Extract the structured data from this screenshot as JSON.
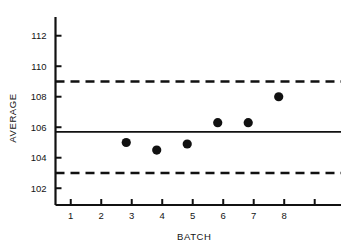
{
  "chart_data": {
    "type": "scatter",
    "title": "",
    "subtitle": "",
    "xlabel": "BATCH",
    "ylabel": "AVERAGE",
    "x": [
      3,
      4,
      5,
      6,
      7,
      8
    ],
    "values": [
      105.0,
      104.5,
      104.9,
      106.3,
      106.3,
      108.0
    ],
    "series": [
      {
        "name": "Batch average",
        "x": [
          3,
          4,
          5,
          6,
          7,
          8
        ],
        "values": [
          105.0,
          104.5,
          104.9,
          106.3,
          106.3,
          108.0
        ]
      }
    ],
    "xlim": [
      0.5,
      9.6
    ],
    "ylim": [
      100.9,
      112.9
    ],
    "xticks": [
      1,
      2,
      3,
      4,
      5,
      6,
      7,
      8,
      9
    ],
    "xtick_labels": [
      "1",
      "2",
      "3",
      "4",
      "5",
      "6",
      "7",
      "8",
      ""
    ],
    "yticks": [
      102,
      104,
      106,
      108,
      110,
      112
    ],
    "ytick_labels": [
      "102",
      "104",
      "106",
      "108",
      "110",
      "112"
    ],
    "grid": false,
    "legend": false,
    "legend_position": "none",
    "reference_lines": [
      {
        "name": "upper-control-limit",
        "value": 109.0,
        "style": "dashed"
      },
      {
        "name": "center-line",
        "value": 105.7,
        "style": "solid"
      },
      {
        "name": "lower-control-limit",
        "value": 103.0,
        "style": "dashed"
      }
    ],
    "marker": {
      "shape": "circle",
      "color": "#111111",
      "size": 4.6
    },
    "colors": {
      "axis": "#111111",
      "center_line": "#111111",
      "control_limit": "#111111",
      "marker": "#111111",
      "background": "#ffffff"
    }
  }
}
